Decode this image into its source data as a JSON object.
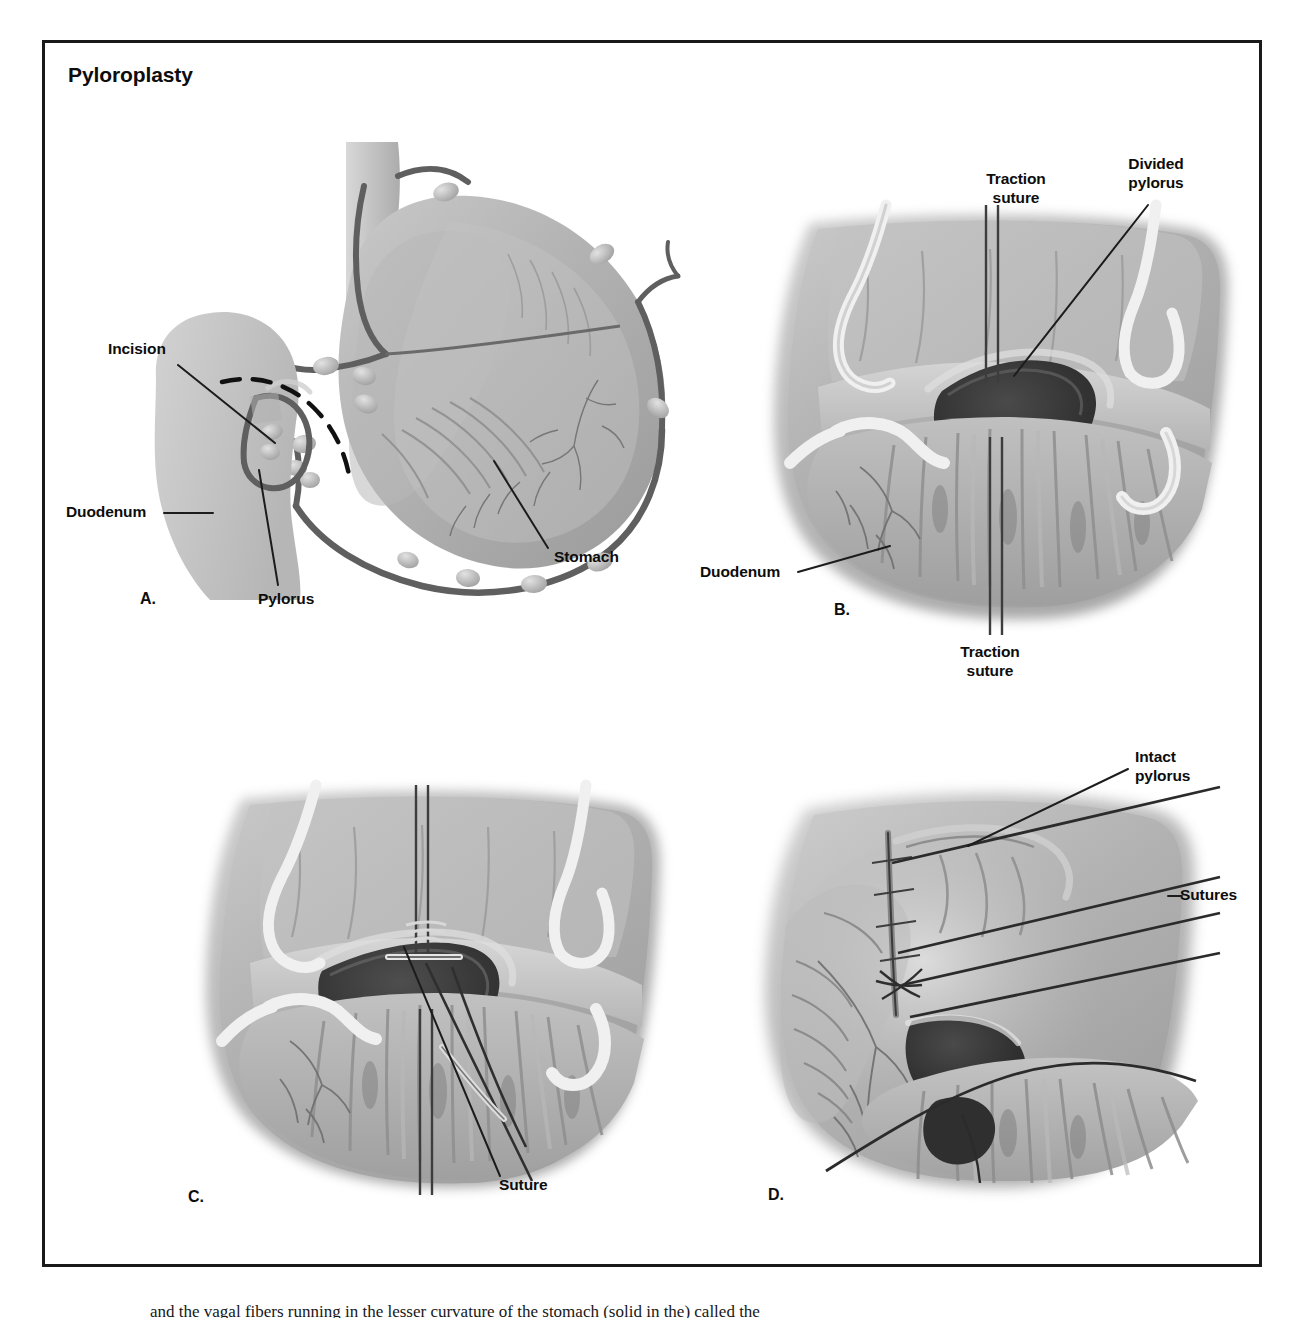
{
  "figure": {
    "title": "Pyloroplasty",
    "caption_partial": "and the vagal fibers running in the lesser curvature of the stomach (solid in the) called the"
  },
  "panels": [
    {
      "id": "A",
      "letter": "A.",
      "labels": [
        {
          "name": "incision",
          "text": "Incision"
        },
        {
          "name": "duodenum",
          "text": "Duodenum"
        },
        {
          "name": "pylorus",
          "text": "Pylorus"
        },
        {
          "name": "stomach",
          "text": "Stomach"
        }
      ]
    },
    {
      "id": "B",
      "letter": "B.",
      "labels": [
        {
          "name": "traction-suture-top",
          "text": "Traction\nsuture"
        },
        {
          "name": "divided-pylorus",
          "text": "Divided\npylorus"
        },
        {
          "name": "duodenum",
          "text": "Duodenum"
        },
        {
          "name": "traction-suture-bottom",
          "text": "Traction\nsuture"
        }
      ]
    },
    {
      "id": "C",
      "letter": "C.",
      "labels": [
        {
          "name": "suture",
          "text": "Suture"
        }
      ]
    },
    {
      "id": "D",
      "letter": "D.",
      "labels": [
        {
          "name": "intact-pylorus",
          "text": "Intact\npylorus"
        },
        {
          "name": "sutures",
          "text": "Sutures"
        }
      ]
    }
  ],
  "colors": {
    "frame": "#1a1a1a",
    "text": "#0d0d0d",
    "leader": "#1c1c1c",
    "tissue_light": "#cfcfcf",
    "tissue_mid": "#a8a8a8",
    "tissue_dark": "#8a8a8a",
    "vessel": "#6e6e6e",
    "lumen_dark": "#3b3b3b",
    "suture_white": "#f2f2f2"
  }
}
